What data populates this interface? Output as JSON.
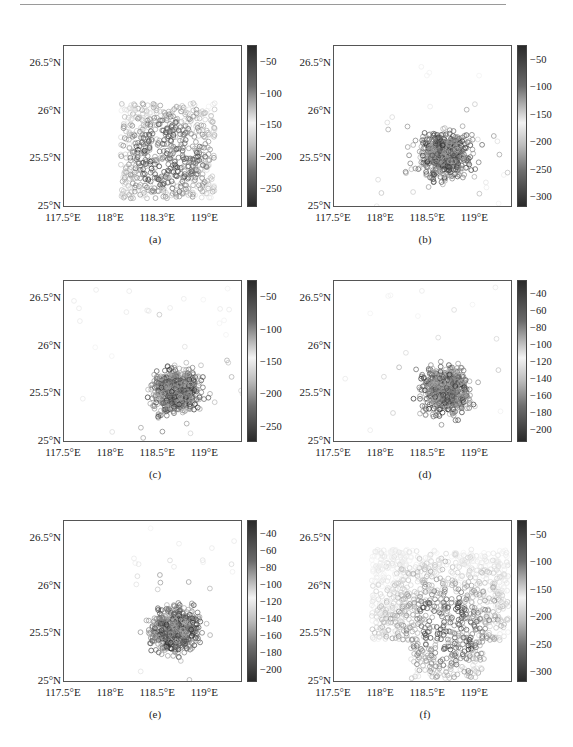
{
  "page": {
    "rule": true
  },
  "chart_data": [
    {
      "type": "scatter",
      "panel": "a",
      "caption": "(a)",
      "xlabel": "",
      "ylabel": "",
      "xticks": [
        "117.5°E",
        "118°E",
        "118.3°E",
        "119°E"
      ],
      "xlim": [
        117.5,
        119.4
      ],
      "yticks": [
        "25°N",
        "25.5°N",
        "26°N",
        "26.5°N"
      ],
      "ylim": [
        25.0,
        26.7
      ],
      "colorbar": {
        "ticks": [
          -50,
          -100,
          -150,
          -200,
          -250
        ],
        "range": [
          -280,
          -25
        ],
        "colormap": "grayscale: dark at ends, light in middle"
      },
      "extent": {
        "lon": [
          118.1,
          119.1
        ],
        "lat": [
          25.1,
          26.1
        ]
      },
      "marker": "open-circle",
      "description": "Dense square grid of points 118.1–119.1°E, 25.1–26.1°N; darker clusters near 118.2–118.4°E 25.5–25.7°N and 118.6–118.9°E 25.2–25.8°N"
    },
    {
      "type": "scatter",
      "panel": "b",
      "caption": "(b)",
      "xticks": [
        "117.5°E",
        "118°E",
        "118.5°E",
        "119°E"
      ],
      "xlim": [
        117.5,
        119.4
      ],
      "yticks": [
        "25°N",
        "25.5°N",
        "26°N",
        "26.5°N"
      ],
      "ylim": [
        25.0,
        26.7
      ],
      "colorbar": {
        "ticks": [
          -50,
          -100,
          -150,
          -200,
          -250,
          -300
        ],
        "range": [
          -320,
          -25
        ],
        "colormap": "grayscale: dark at ends, light in middle"
      },
      "extent": {
        "lon": [
          117.9,
          119.4
        ],
        "lat": [
          25.0,
          26.5
        ]
      },
      "marker": "open-circle",
      "description": "Scattered points centered near 118.7°E 25.5°N with dark core; sparse outliers to 117.9°E and 26.5°N"
    },
    {
      "type": "scatter",
      "panel": "c",
      "caption": "(c)",
      "xticks": [
        "117.5°E",
        "118°E",
        "118.5°E",
        "119°E"
      ],
      "xlim": [
        117.5,
        119.4
      ],
      "yticks": [
        "25°N",
        "25.5°N",
        "26°N",
        "26.5°N"
      ],
      "ylim": [
        25.0,
        26.7
      ],
      "colorbar": {
        "ticks": [
          -50,
          -100,
          -150,
          -200,
          -250
        ],
        "range": [
          -275,
          -25
        ],
        "colormap": "grayscale: dark at ends, light in middle"
      },
      "extent": {
        "lon": [
          117.6,
          119.4
        ],
        "lat": [
          25.0,
          26.7
        ]
      },
      "marker": "open-circle",
      "description": "Cluster centered near 118.7°E 25.55°N; outliers at 117.6°E 26.5°N, 117.8°E 25.45°N"
    },
    {
      "type": "scatter",
      "panel": "d",
      "caption": "(d)",
      "xticks": [
        "117.5°E",
        "118°E",
        "118.5°E",
        "119°E"
      ],
      "xlim": [
        117.5,
        119.4
      ],
      "yticks": [
        "25°N",
        "25.5°N",
        "26°N",
        "26.5°N"
      ],
      "ylim": [
        25.0,
        26.7
      ],
      "colorbar": {
        "ticks": [
          -40,
          -60,
          -80,
          -100,
          -120,
          -140,
          -160,
          -180,
          -200
        ],
        "range": [
          -215,
          -25
        ],
        "colormap": "grayscale: dark at ends, light in middle"
      },
      "extent": {
        "lon": [
          117.6,
          119.4
        ],
        "lat": [
          25.0,
          26.7
        ]
      },
      "marker": "open-circle",
      "description": "Cluster centered near 118.65°E 25.55°N; outliers at 117.6°E 25.2°N and 118.0°E 26.5°N"
    },
    {
      "type": "scatter",
      "panel": "e",
      "caption": "(e)",
      "xticks": [
        "117.5°E",
        "118°E",
        "118.5°E",
        "119°E"
      ],
      "xlim": [
        117.5,
        119.4
      ],
      "yticks": [
        "25°N",
        "25.5°N",
        "26°N",
        "26.5°N"
      ],
      "ylim": [
        25.0,
        26.7
      ],
      "colorbar": {
        "ticks": [
          -40,
          -60,
          -80,
          -100,
          -120,
          -140,
          -160,
          -180,
          -200
        ],
        "range": [
          -215,
          -25
        ],
        "colormap": "grayscale: dark at ends, light in middle"
      },
      "extent": {
        "lon": [
          118.2,
          119.4
        ],
        "lat": [
          25.0,
          26.65
        ]
      },
      "marker": "open-circle",
      "description": "Compact cluster centered near 118.65°E 25.55°N; few outliers up to 26.65°N"
    },
    {
      "type": "scatter",
      "panel": "f",
      "caption": "(f)",
      "xticks": [
        "117.5°E",
        "118°E",
        "118.5°E",
        "119°E"
      ],
      "xlim": [
        117.5,
        119.4
      ],
      "yticks": [
        "25°N",
        "25.5°N",
        "26°N",
        "26.5°N"
      ],
      "ylim": [
        25.0,
        26.7
      ],
      "colorbar": {
        "ticks": [
          -50,
          -100,
          -150,
          -200,
          -250,
          -300
        ],
        "range": [
          -320,
          -25
        ],
        "colormap": "grayscale: dark at ends, light in middle"
      },
      "extent": {
        "lon": [
          117.9,
          119.35
        ],
        "lat": [
          25.05,
          26.4
        ]
      },
      "marker": "open-circle",
      "description": "Very dense points filling 117.9–119.0°E, 25.4–26.4°N plus southern lobe to 25.05°N near 118.6°E; darkest around 118.5–118.8°E 25.3–25.5°N"
    }
  ]
}
